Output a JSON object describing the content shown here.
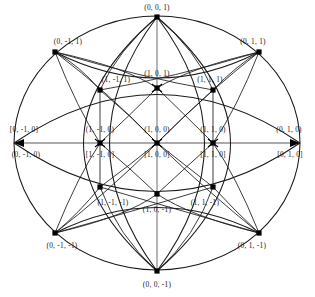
{
  "figure": {
    "type": "sphere-direction-graph",
    "background_color": "#ffffff",
    "stroke_color": "#1a1a1a",
    "axis_color": "#8c8c8c",
    "node_color": "#000000"
  },
  "nodes": [
    {
      "id": "n_0_0_1",
      "label": "(0, 0, 1)",
      "x": 157,
      "y": 8,
      "dot_x": 157,
      "dot_y": 17,
      "marker": "square"
    },
    {
      "id": "n_0_m1_1",
      "label": "(0, -1, 1)",
      "x": 68,
      "y": 42,
      "dot_x": 55,
      "dot_y": 52,
      "marker": "square"
    },
    {
      "id": "n_0_1_1",
      "label": "(0, 1, 1)",
      "x": 253,
      "y": 42,
      "dot_x": 259,
      "dot_y": 52,
      "marker": "square"
    },
    {
      "id": "n_1_m1_1",
      "label": "(1, -1, 1)",
      "x": 116,
      "y": 80,
      "dot_x": 100,
      "dot_y": 90,
      "marker": "square"
    },
    {
      "id": "n_1_0_1",
      "label": "(1, 0, 1)",
      "x": 157,
      "y": 74,
      "dot_x": 157,
      "dot_y": 88,
      "marker": "star"
    },
    {
      "id": "n_1_1_1",
      "label": "(1, 1, 1)",
      "x": 210,
      "y": 80,
      "dot_x": 213,
      "dot_y": 90,
      "marker": "square"
    },
    {
      "id": "n_0_m1_0_b",
      "label": "[0, -1, 0]",
      "x": 24,
      "y": 130,
      "dot_x": 14,
      "dot_y": 143,
      "marker": "arrow-left"
    },
    {
      "id": "n_0_m1_0_p",
      "label": "(0, -1, 0)",
      "x": 26,
      "y": 155,
      "dot_x": null,
      "dot_y": null,
      "marker": "none"
    },
    {
      "id": "n_1_m1_0_p",
      "label": "(1, -1, 0)",
      "x": 100,
      "y": 130,
      "dot_x": 100,
      "dot_y": 143,
      "marker": "star"
    },
    {
      "id": "n_1_m1_0_b",
      "label": "[1, -1, 0]",
      "x": 100,
      "y": 155,
      "dot_x": null,
      "dot_y": null,
      "marker": "none"
    },
    {
      "id": "n_1_0_0_p",
      "label": "(1, 0, 0)",
      "x": 157,
      "y": 130,
      "dot_x": 157,
      "dot_y": 143,
      "marker": "star"
    },
    {
      "id": "n_1_0_0_b",
      "label": "[1, 0, 0]",
      "x": 157,
      "y": 155,
      "dot_x": null,
      "dot_y": null,
      "marker": "none"
    },
    {
      "id": "n_1_1_0_p",
      "label": "(1, 1, 0)",
      "x": 213,
      "y": 130,
      "dot_x": 213,
      "dot_y": 143,
      "marker": "star"
    },
    {
      "id": "n_1_1_0_b",
      "label": "[1, 1, 0]",
      "x": 213,
      "y": 155,
      "dot_x": null,
      "dot_y": null,
      "marker": "none"
    },
    {
      "id": "n_0_1_0_p",
      "label": "(0, 1, 0)",
      "x": 289,
      "y": 130,
      "dot_x": 300,
      "dot_y": 143,
      "marker": "arrow-right"
    },
    {
      "id": "n_0_1_0_b",
      "label": "[0, 1, 0]",
      "x": 290,
      "y": 155,
      "dot_x": null,
      "dot_y": null,
      "marker": "none"
    },
    {
      "id": "n_1_m1_m1",
      "label": "(1, -1, -1)",
      "x": 113,
      "y": 203,
      "dot_x": 100,
      "dot_y": 187,
      "marker": "square"
    },
    {
      "id": "n_1_0_m1",
      "label": "(1, 0, -1)",
      "x": 157,
      "y": 210,
      "dot_x": 157,
      "dot_y": 194,
      "marker": "square"
    },
    {
      "id": "n_1_1_m1",
      "label": "(1, 1, -1)",
      "x": 205,
      "y": 203,
      "dot_x": 213,
      "dot_y": 187,
      "marker": "square"
    },
    {
      "id": "n_0_m1_m1",
      "label": "(0, -1, -1)",
      "x": 62,
      "y": 246,
      "dot_x": 55,
      "dot_y": 233,
      "marker": "square"
    },
    {
      "id": "n_0_1_m1",
      "label": "(0, 1, -1)",
      "x": 252,
      "y": 246,
      "dot_x": 259,
      "dot_y": 233,
      "marker": "square"
    },
    {
      "id": "n_0_0_m1",
      "label": "(0, 0, -1)",
      "x": 157,
      "y": 285,
      "dot_x": 157,
      "dot_y": 271,
      "marker": "square"
    }
  ],
  "geometry": {
    "center_x": 157,
    "center_y": 143,
    "radius_x": 143,
    "radius_y": 127
  }
}
